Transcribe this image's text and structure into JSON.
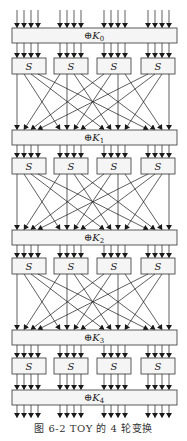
{
  "figure": {
    "caption": "图 6-2   TOY 的 4 轮变换",
    "key_labels": [
      "⊕K0",
      "⊕K1",
      "⊕K2",
      "⊕K3",
      "⊕K4"
    ],
    "key_subscripts": [
      "0",
      "1",
      "2",
      "3",
      "4"
    ],
    "sbox_label": "S",
    "rounds": 4,
    "sboxes_per_round": 4,
    "bits_per_sbox": 4
  },
  "colors": {
    "line": "#1a1a1a",
    "box_fill": "#f5f5f5",
    "box_stroke": "#333333",
    "background": "#ffffff"
  }
}
